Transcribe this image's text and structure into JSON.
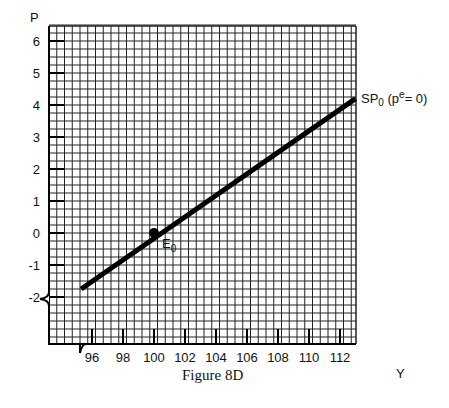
{
  "chart_data": {
    "type": "line",
    "title": "",
    "caption": "Figure 8D",
    "xlabel": "Y",
    "ylabel": "P",
    "x_ticks": [
      "96",
      "98",
      "100",
      "102",
      "104",
      "106",
      "108",
      "110",
      "112"
    ],
    "y_ticks": [
      "6",
      "5",
      "4",
      "3",
      "2",
      "1",
      "0",
      "-1",
      "-2"
    ],
    "xlim": [
      94,
      113.5
    ],
    "ylim": [
      -3.5,
      6.5
    ],
    "grid": true,
    "axis_breaks": [
      "x",
      "y"
    ],
    "series": [
      {
        "name": "SP0 (pe = 0)",
        "x": [
          95.3,
          113
        ],
        "y": [
          -1.75,
          4.2
        ]
      }
    ],
    "annotations": [
      {
        "text": "E0",
        "x": 100,
        "y": 0,
        "marker": "dot"
      },
      {
        "text": "SP0 (pe = 0)",
        "x": 113,
        "y": 4.2
      }
    ]
  },
  "labels": {
    "y_axis": "P",
    "x_axis": "Y",
    "caption": "Figure 8D",
    "curve_main": "SP",
    "curve_sub": "0",
    "curve_paren_open": " (p",
    "curve_sup": "e",
    "curve_paren_close": "= 0)",
    "point_main": "E",
    "point_sub": "0"
  }
}
